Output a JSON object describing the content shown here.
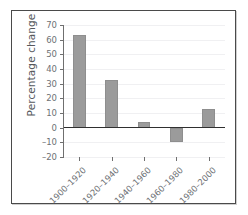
{
  "chart_data": {
    "type": "bar",
    "title": "",
    "subtitle": "",
    "xlabel": "",
    "ylabel": "Percentage change",
    "categories": [
      "1900–1920",
      "1920–1940",
      "1940–1960",
      "1960–1980",
      "1980–2000"
    ],
    "values": [
      63.5,
      32.5,
      4,
      -9.5,
      12.5
    ],
    "series": [
      {
        "name": "Percentage change",
        "values": [
          63.5,
          32.5,
          4,
          -9.5,
          12.5
        ]
      }
    ],
    "ylim": [
      -20,
      70
    ],
    "xlim": [
      0,
      5
    ],
    "ytick_labels": [
      "70",
      "60",
      "50",
      "40",
      "30",
      "20",
      "10",
      "0",
      "–10",
      "–20"
    ],
    "ytick_values": [
      70,
      60,
      50,
      40,
      30,
      20,
      10,
      0,
      -10,
      -20
    ],
    "ytick_step": 10,
    "grid": true,
    "grid_axis": "y",
    "legend": false,
    "legend_position": "none",
    "zero_line": true,
    "annotations": [],
    "colors": {
      "bar_fill": "#9b9b9b",
      "bar_edge": "#8e8e8e",
      "grid": "#f0f0f2",
      "axis": "#6f6f6f",
      "zero_line": "#2f2f2f",
      "tick_label": "#6e7175",
      "axis_title": "#55585c",
      "frame_border": "#4a4a4a",
      "background": "#ffffff"
    }
  }
}
